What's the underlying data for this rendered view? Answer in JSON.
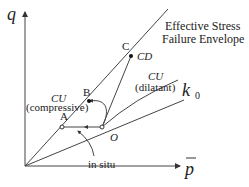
{
  "axes": {
    "y_label": "q",
    "x_label": "p",
    "x_label_overbar": true
  },
  "labels": {
    "envelope_line1": "Effective Stress",
    "envelope_line2": "Failure Envelope",
    "point_a": "A",
    "point_b": "B",
    "point_c": "C",
    "point_o": "O",
    "cd": "CD",
    "cu_compressive_1": "CU",
    "cu_compressive_2": "(compressive)",
    "cu_dilatant_1": "CU",
    "cu_dilatant_2": "(dilatant)",
    "k0": "k",
    "k0_sub": "0",
    "in_situ": "in situ"
  },
  "colors": {
    "line": "#444444",
    "text": "#222222",
    "background": "#ffffff"
  }
}
